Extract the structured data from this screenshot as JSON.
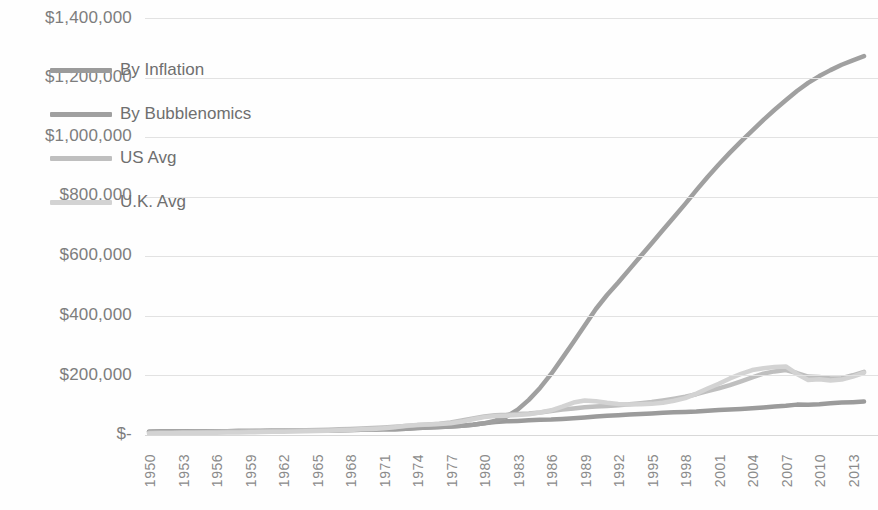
{
  "chart_data": {
    "type": "line",
    "title": "",
    "subtitle": "",
    "xlabel": "",
    "ylabel": "",
    "grid": true,
    "legend_position": "inside-upper-left",
    "ylim": [
      0,
      1400000
    ],
    "ytick_values": [
      1400000,
      1200000,
      1000000,
      800000,
      600000,
      400000,
      200000,
      0
    ],
    "ytick_labels": [
      "$1,400,000",
      "$1,200,000",
      "$1,000,000",
      "$800,000",
      "$600,000",
      "$400,000",
      "$200,000",
      "$-"
    ],
    "xlim": [
      1950,
      2014
    ],
    "xtick_labels": [
      "1950",
      "1953",
      "1956",
      "1959",
      "1962",
      "1965",
      "1968",
      "1971",
      "1974",
      "1977",
      "1980",
      "1983",
      "1986",
      "1989",
      "1992",
      "1995",
      "1998",
      "2001",
      "2004",
      "2007",
      "2010",
      "2013"
    ],
    "x": [
      1950,
      1951,
      1952,
      1953,
      1954,
      1955,
      1956,
      1957,
      1958,
      1959,
      1960,
      1961,
      1962,
      1963,
      1964,
      1965,
      1966,
      1967,
      1968,
      1969,
      1970,
      1971,
      1972,
      1973,
      1974,
      1975,
      1976,
      1977,
      1978,
      1979,
      1980,
      1981,
      1982,
      1983,
      1984,
      1985,
      1986,
      1987,
      1988,
      1989,
      1990,
      1991,
      1992,
      1993,
      1994,
      1995,
      1996,
      1997,
      1998,
      1999,
      2000,
      2001,
      2002,
      2003,
      2004,
      2005,
      2006,
      2007,
      2008,
      2009,
      2010,
      2011,
      2012,
      2013,
      2014
    ],
    "series": [
      {
        "name": "By Inflation",
        "color": "#9b9b9b",
        "values": [
          11000,
          11800,
          12000,
          12100,
          12200,
          12400,
          12600,
          13000,
          13400,
          13600,
          13800,
          14000,
          14200,
          14400,
          14600,
          14900,
          15300,
          15800,
          16400,
          17300,
          18300,
          19100,
          19700,
          21000,
          23300,
          25500,
          27000,
          28700,
          30900,
          34500,
          39100,
          43200,
          45800,
          47300,
          49300,
          51100,
          52000,
          53900,
          56100,
          58800,
          62000,
          64600,
          66500,
          68500,
          70300,
          72300,
          74400,
          76100,
          77300,
          78900,
          81600,
          83900,
          85200,
          87200,
          89500,
          92500,
          95500,
          98200,
          102000,
          101800,
          103300,
          106400,
          108700,
          110300,
          112100
        ]
      },
      {
        "name": "By Bubblenomics",
        "color": "#a0a0a0",
        "values": [
          11000,
          11800,
          12000,
          12100,
          12200,
          12400,
          12600,
          13000,
          13400,
          13600,
          13800,
          14000,
          14200,
          14400,
          14600,
          14900,
          15300,
          15800,
          16400,
          17300,
          18300,
          19100,
          19700,
          21000,
          23300,
          25500,
          27000,
          28700,
          30900,
          34500,
          39100,
          48000,
          62000,
          85000,
          118000,
          158000,
          205000,
          258000,
          312000,
          368000,
          423000,
          470000,
          512000,
          556000,
          600000,
          644000,
          688000,
          732000,
          776000,
          822000,
          866000,
          908000,
          948000,
          986000,
          1022000,
          1058000,
          1092000,
          1124000,
          1155000,
          1182000,
          1205000,
          1225000,
          1243000,
          1258000,
          1272000
        ]
      },
      {
        "name": "US Avg",
        "color": "#bfbfbf",
        "values": [
          7400,
          8000,
          8600,
          9200,
          9700,
          10300,
          10900,
          11500,
          12100,
          12800,
          13400,
          14000,
          14600,
          15400,
          16200,
          17100,
          18000,
          19100,
          20400,
          22000,
          23400,
          25100,
          27600,
          30000,
          32700,
          35300,
          38100,
          42200,
          48700,
          55700,
          62200,
          66400,
          67800,
          70300,
          72400,
          75500,
          80300,
          85300,
          89300,
          93100,
          95500,
          97100,
          99700,
          103500,
          107000,
          110500,
          115800,
          121800,
          128400,
          137000,
          147300,
          156800,
          167500,
          180300,
          193600,
          206000,
          213500,
          217800,
          208000,
          196000,
          194500,
          189500,
          190500,
          200500,
          212000
        ]
      },
      {
        "name": "U.K. Avg",
        "color": "#d3d3d3",
        "values": [
          5200,
          5600,
          6000,
          6400,
          6800,
          7200,
          7700,
          8200,
          8700,
          9300,
          9900,
          10600,
          11200,
          11900,
          12800,
          13700,
          14600,
          15800,
          17200,
          18900,
          20200,
          22300,
          26000,
          31000,
          34000,
          35500,
          37200,
          39500,
          45000,
          53000,
          60000,
          63500,
          65000,
          67000,
          70000,
          75500,
          83000,
          95000,
          109000,
          116000,
          113000,
          108000,
          104000,
          102000,
          103500,
          104500,
          108000,
          115000,
          124000,
          139000,
          156000,
          172000,
          190000,
          205000,
          218000,
          224000,
          228000,
          230000,
          205000,
          185000,
          187000,
          183000,
          186000,
          196000,
          209000
        ]
      }
    ],
    "legend_entries": [
      {
        "label": "By Inflation",
        "color": "#9b9b9b"
      },
      {
        "label": "By Bubblenomics",
        "color": "#a0a0a0"
      },
      {
        "label": "US Avg",
        "color": "#bfbfbf"
      },
      {
        "label": "U.K. Avg",
        "color": "#d3d3d3"
      }
    ]
  },
  "axis": {
    "y_tick_0": "$1,400,000",
    "y_tick_1": "$1,200,000",
    "y_tick_2": "$1,000,000",
    "y_tick_3": "$800,000",
    "y_tick_4": "$600,000",
    "y_tick_5": "$400,000",
    "y_tick_6": "$200,000",
    "y_tick_7": "$-"
  }
}
